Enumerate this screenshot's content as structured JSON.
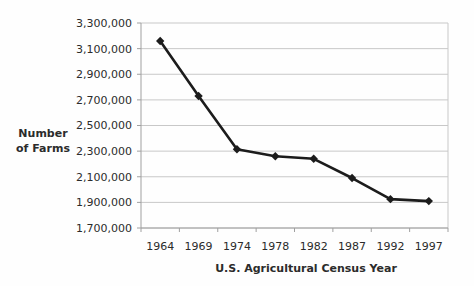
{
  "chart_data": {
    "type": "line",
    "title": "",
    "xlabel": "U.S. Agricultural Census Year",
    "ylabel": "Number of Farms",
    "ylabel_lines": [
      "Number",
      "of Farms"
    ],
    "categories": [
      "1964",
      "1969",
      "1974",
      "1978",
      "1982",
      "1987",
      "1992",
      "1997"
    ],
    "series": [
      {
        "name": "Number of Farms",
        "values": [
          3160000,
          2730000,
          2315000,
          2260000,
          2240000,
          2090000,
          1925000,
          1910000
        ]
      }
    ],
    "ylim": [
      1700000,
      3300000
    ],
    "ytick_step": 200000,
    "ytick_labels": [
      "3,300,000",
      "3,100,000",
      "2,900,000",
      "2,700,000",
      "2,500,000",
      "2,300,000",
      "2,100,000",
      "1,900,000",
      "1,700,000"
    ],
    "grid": "horizontal",
    "legend": "none",
    "marker": "diamond",
    "colors": {
      "line": "#1c1c1c",
      "marker": "#1c1c1c",
      "gridline": "#c8c8c8",
      "axis": "#a0a0a0",
      "text": "#2b2b2b",
      "background": "#ffffff"
    }
  }
}
